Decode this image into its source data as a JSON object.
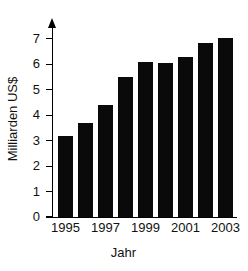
{
  "chart_data": {
    "type": "bar",
    "title": "",
    "xlabel": "Jahr",
    "ylabel": "Milliarden US$",
    "categories": [
      "1995",
      "1996",
      "1997",
      "1998",
      "1999",
      "2000",
      "2001",
      "2002",
      "2003"
    ],
    "values": [
      3.2,
      3.7,
      4.4,
      5.5,
      6.1,
      6.05,
      6.3,
      6.85,
      7.05
    ],
    "ylim": [
      0,
      7.35
    ],
    "yticks": [
      0,
      1,
      2,
      3,
      4,
      5,
      6,
      7
    ],
    "ytick_labels": [
      "0",
      "1",
      "2",
      "3",
      "4",
      "5",
      "6",
      "7"
    ],
    "xtick_labels": [
      "1995",
      "1997",
      "1999",
      "2001",
      "2003"
    ],
    "xtick_categories": [
      "1995",
      "1997",
      "1999",
      "2001",
      "2003"
    ],
    "grid": false,
    "legend": false,
    "bar_color": "#0a0a0a",
    "axis_color": "#000000",
    "background_color": "#ffffff"
  },
  "axes": {
    "y_axis_title": "Milliarden US$",
    "x_axis_title": "Jahr"
  }
}
